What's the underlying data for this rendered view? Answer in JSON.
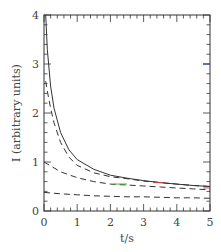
{
  "chart_data": {
    "type": "line",
    "title": "",
    "xlabel": "t/s",
    "ylabel": "I (arbitrary units)",
    "xlim": [
      0,
      5
    ],
    "ylim": [
      0,
      4
    ],
    "xticks": [
      0,
      1,
      2,
      3,
      4,
      5
    ],
    "yticks": [
      0,
      1,
      2,
      3,
      4
    ],
    "xtick_labels": [
      "0",
      "1",
      "2",
      "3",
      "4",
      "5"
    ],
    "ytick_labels": [
      "0",
      "1",
      "2",
      "3",
      "4"
    ],
    "grid": false,
    "legend": null,
    "series": [
      {
        "name": "total",
        "style": "solid",
        "color": "#333333",
        "x": [
          0.05,
          0.1,
          0.2,
          0.3,
          0.5,
          0.75,
          1.0,
          1.5,
          2.0,
          2.5,
          3.0,
          3.5,
          4.0,
          4.5,
          5.0
        ],
        "y": [
          4.0,
          3.3,
          2.55,
          2.1,
          1.6,
          1.25,
          1.05,
          0.85,
          0.73,
          0.67,
          0.62,
          0.58,
          0.55,
          0.52,
          0.5
        ]
      },
      {
        "name": "component-1",
        "style": "dashed",
        "color": "#333333",
        "x": [
          0.05,
          0.1,
          0.2,
          0.3,
          0.5,
          0.75,
          1.0,
          1.5,
          2.0,
          2.5,
          3.0,
          3.5,
          4.0,
          4.5,
          5.0
        ],
        "y": [
          2.65,
          2.45,
          2.1,
          1.8,
          1.4,
          1.1,
          0.93,
          0.78,
          0.7,
          0.66,
          0.61,
          0.58,
          0.55,
          0.52,
          0.5
        ]
      },
      {
        "name": "component-2",
        "style": "dashed",
        "color": "#333333",
        "x": [
          0.0,
          0.25,
          0.5,
          1.0,
          1.5,
          2.0,
          2.5,
          3.0,
          3.5,
          4.0,
          4.5,
          5.0
        ],
        "y": [
          1.0,
          0.9,
          0.8,
          0.68,
          0.6,
          0.55,
          0.53,
          0.51,
          0.49,
          0.47,
          0.45,
          0.43
        ]
      },
      {
        "name": "component-3",
        "style": "dashed",
        "color": "#333333",
        "x": [
          0.0,
          0.5,
          1.0,
          1.5,
          2.0,
          2.5,
          3.0,
          3.5,
          4.0,
          4.5,
          5.0
        ],
        "y": [
          0.38,
          0.35,
          0.33,
          0.31,
          0.3,
          0.29,
          0.29,
          0.28,
          0.27,
          0.27,
          0.26
        ]
      }
    ],
    "annotations": [
      {
        "type": "highlight",
        "color": "#44aa44",
        "x_range": [
          2.1,
          2.5
        ],
        "y": 0.55
      },
      {
        "type": "highlight",
        "color": "#cc4444",
        "x_range": [
          3.3,
          3.6
        ],
        "y": 0.58
      },
      {
        "type": "highlight",
        "color": "#cc4444",
        "x_range": [
          4.8,
          5.0
        ],
        "y": 0.47
      },
      {
        "type": "tick",
        "color": "#3344aa",
        "x": 5.0,
        "y": 3.0
      }
    ],
    "colors": {
      "frame": "#333333",
      "line": "#333333",
      "blue_tick": "#3344aa"
    }
  }
}
